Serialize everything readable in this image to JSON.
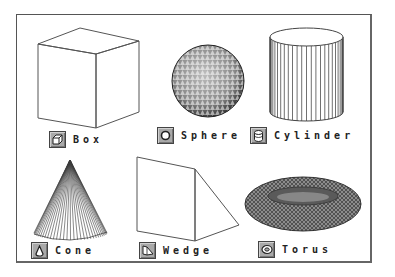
{
  "palette": {
    "frame_border": "#555555",
    "icon_bg": "#a9a9a9",
    "icon_border": "#444444",
    "label_color": "#222222",
    "wire_color": "#333333"
  },
  "primitives": [
    {
      "id": "box",
      "label": "Box",
      "icon": "box-icon"
    },
    {
      "id": "sphere",
      "label": "Sphere",
      "icon": "sphere-icon"
    },
    {
      "id": "cylinder",
      "label": "Cylinder",
      "icon": "cylinder-icon"
    },
    {
      "id": "cone",
      "label": "Cone",
      "icon": "cone-icon"
    },
    {
      "id": "wedge",
      "label": "Wedge",
      "icon": "wedge-icon"
    },
    {
      "id": "torus",
      "label": "Torus",
      "icon": "torus-icon"
    }
  ]
}
